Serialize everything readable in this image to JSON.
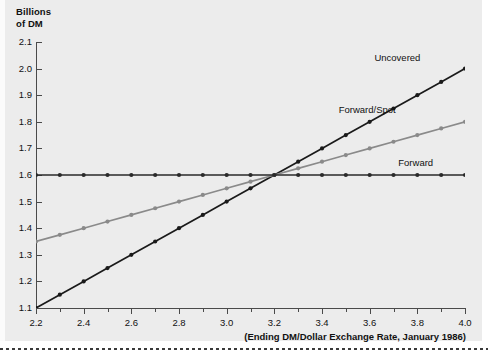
{
  "chart_data": {
    "type": "line",
    "title": "",
    "ylabel": "Billions\nof DM",
    "xlabel": "(Ending DM/Dollar Exchange Rate, January 1986)",
    "xlim": [
      2.2,
      4.0
    ],
    "ylim": [
      1.1,
      2.1
    ],
    "grid": false,
    "legend_position": "inline-right-of-line-ends",
    "x_major_step": 0.2,
    "x_minor_step": 0.1,
    "y_step": 0.1,
    "x_ticklabels": [
      "2.2",
      "2.4",
      "2.6",
      "2.8",
      "3.0",
      "3.2",
      "3.4",
      "3.6",
      "3.8",
      "4.0"
    ],
    "y_ticklabels": [
      "1.1",
      "1.2",
      "1.3",
      "1.4",
      "1.5",
      "1.6",
      "1.7",
      "1.8",
      "1.9",
      "2.0",
      "2.1"
    ],
    "x": [
      2.2,
      2.3,
      2.4,
      2.5,
      2.6,
      2.7,
      2.8,
      2.9,
      3.0,
      3.1,
      3.2,
      3.3,
      3.4,
      3.5,
      3.6,
      3.7,
      3.8,
      3.9,
      4.0
    ],
    "series": [
      {
        "name": "Uncovered",
        "color": "#1a1a1a",
        "values": [
          1.1,
          1.15,
          1.2,
          1.25,
          1.3,
          1.35,
          1.4,
          1.45,
          1.5,
          1.55,
          1.6,
          1.65,
          1.7,
          1.75,
          1.8,
          1.85,
          1.9,
          1.95,
          2.0
        ],
        "label_x": 3.62,
        "label_y": 2.04
      },
      {
        "name": "Forward/Spot",
        "color": "#8a8a8a",
        "values": [
          1.35,
          1.375,
          1.4,
          1.425,
          1.45,
          1.475,
          1.5,
          1.525,
          1.55,
          1.575,
          1.6,
          1.625,
          1.65,
          1.675,
          1.7,
          1.725,
          1.75,
          1.775,
          1.8
        ],
        "label_x": 3.47,
        "label_y": 1.845
      },
      {
        "name": "Forward",
        "color": "#2a2a2a",
        "values": [
          1.6,
          1.6,
          1.6,
          1.6,
          1.6,
          1.6,
          1.6,
          1.6,
          1.6,
          1.6,
          1.6,
          1.6,
          1.6,
          1.6,
          1.6,
          1.6,
          1.6,
          1.6,
          1.6
        ],
        "label_x": 3.72,
        "label_y": 1.645
      }
    ]
  },
  "axis": {
    "y_title": "Billions\nof DM",
    "x_caption": "(Ending DM/Dollar Exchange Rate, January 1986)"
  }
}
